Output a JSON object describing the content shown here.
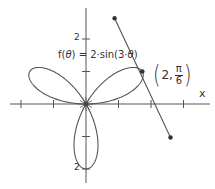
{
  "chart_data": {
    "type": "line",
    "subtype": "polar-rose",
    "title": "",
    "function_label": "f(θ) = 2·sin(3·θ)",
    "function": {
      "name": "f",
      "variable": "θ",
      "expression": "2*sin(3*theta)",
      "amplitude": 2,
      "k": 3
    },
    "xlabel": "x",
    "ylabel": "",
    "x_ticks": [
      -2,
      -1,
      0,
      1,
      2,
      3
    ],
    "y_ticks": [
      -2,
      -1,
      0,
      1,
      2
    ],
    "y_tick_labels": {
      "top": "2",
      "bottom": "2"
    },
    "xlim": [
      -2,
      3
    ],
    "ylim": [
      -2,
      2
    ],
    "grid": false,
    "series": [
      {
        "name": "f(θ) = 2·sin(3·θ)",
        "type": "polar",
        "theta_range": [
          0,
          3.14159
        ],
        "petal_directions_deg": [
          30,
          150,
          270
        ],
        "petal_length": 2
      }
    ],
    "annotations": [
      {
        "type": "point",
        "label": "(2, π/6)",
        "polar": {
          "r": 2,
          "theta": "π/6"
        },
        "cartesian": [
          1.732,
          1.0
        ]
      },
      {
        "type": "tangent_line",
        "through": [
          1.732,
          1.0
        ],
        "endpoints": [
          [
            0.88,
            2.64
          ],
          [
            2.6,
            -1.03
          ]
        ]
      }
    ]
  },
  "labels": {
    "function_prefix": "f(",
    "function_var": "θ",
    "function_suffix": ") = 2·sin(3·",
    "function_var2": "θ",
    "function_close": ")",
    "point_r": "2,",
    "point_num": "π",
    "point_den": "6",
    "paren_open": "(",
    "paren_close": ")",
    "x_axis": "x",
    "y_top": "2",
    "y_bottom": "2"
  },
  "colors": {
    "curve": "#555555",
    "axis": "#555555",
    "point": "#333333",
    "text": "#333333"
  }
}
